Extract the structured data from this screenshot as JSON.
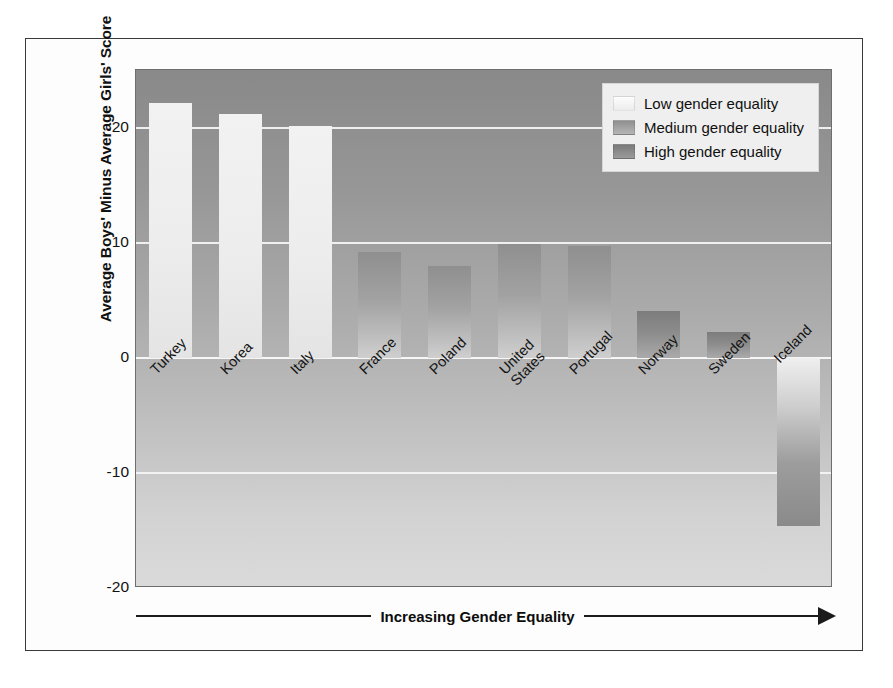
{
  "chart_data": {
    "type": "bar",
    "title": "",
    "xlabel": "Increasing Gender Equality",
    "ylabel": "Average Boys' Minus Average Girls' Score",
    "ylim": [
      -20,
      25
    ],
    "yticks": [
      20,
      10,
      0,
      -10,
      -20
    ],
    "ytick_labels": [
      "20",
      "10",
      "0",
      "-10",
      "-20"
    ],
    "grid": true,
    "legend_position": "top-right",
    "categories": [
      "Turkey",
      "Korea",
      "Italy",
      "France",
      "Poland",
      "United States",
      "Portugal",
      "Norway",
      "Sweden",
      "Iceland"
    ],
    "values": [
      22.1,
      21.2,
      20.1,
      9.2,
      8.0,
      9.9,
      9.7,
      4.1,
      2.2,
      -14.6
    ],
    "groups": [
      "low",
      "low",
      "low",
      "medium",
      "medium",
      "medium",
      "medium",
      "high",
      "high",
      "low"
    ],
    "series": [
      {
        "name": "Average Boys' Minus Average Girls' Score",
        "points": [
          {
            "category": "Turkey",
            "label": "Turkey",
            "value": 22.1,
            "group": "low"
          },
          {
            "category": "Korea",
            "label": "Korea",
            "value": 21.2,
            "group": "low"
          },
          {
            "category": "Italy",
            "label": "Italy",
            "value": 20.1,
            "group": "low"
          },
          {
            "category": "France",
            "label": "France",
            "value": 9.2,
            "group": "medium"
          },
          {
            "category": "Poland",
            "label": "Poland",
            "value": 8.0,
            "group": "medium"
          },
          {
            "category": "United States",
            "label": "United\nStates",
            "value": 9.9,
            "group": "medium"
          },
          {
            "category": "Portugal",
            "label": "Portugal",
            "value": 9.7,
            "group": "medium"
          },
          {
            "category": "Norway",
            "label": "Norway",
            "value": 4.1,
            "group": "high"
          },
          {
            "category": "Sweden",
            "label": "Sweden",
            "value": 2.2,
            "group": "high"
          },
          {
            "category": "Iceland",
            "label": "Iceland",
            "value": -14.6,
            "group": "low"
          }
        ]
      }
    ],
    "legend": [
      {
        "key": "low",
        "label": "Low gender equality",
        "color": "#ededed"
      },
      {
        "key": "medium",
        "label": "Medium gender equality",
        "color": "#a2a2a2"
      },
      {
        "key": "high",
        "label": "High gender equality",
        "color": "#8b8b8b"
      }
    ],
    "colors": {
      "plot_background_top": "#898989",
      "plot_background_bottom": "#dadada",
      "gridline": "#f4f4f4",
      "frame_border": "#3a3a3a",
      "text": "#111111"
    }
  }
}
